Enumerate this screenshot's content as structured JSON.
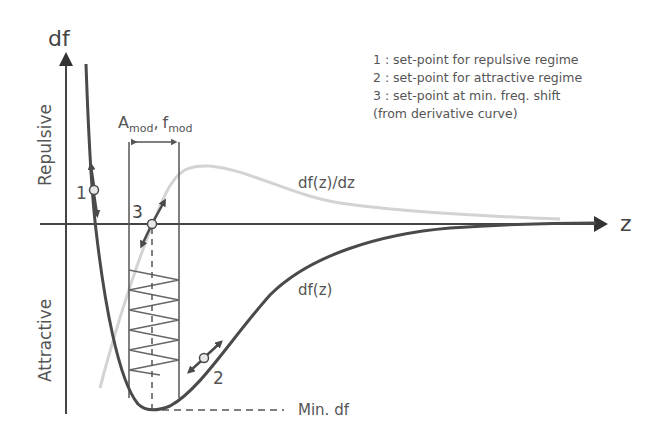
{
  "axes": {
    "y_label": "df",
    "x_label": "z",
    "upper_region": "Repulsive",
    "lower_region": "Attractive"
  },
  "curves": {
    "df": {
      "label": "df(z)",
      "color": "#4a4a4a"
    },
    "derivative": {
      "label": "df(z)/dz",
      "color": "#cfcfcf"
    }
  },
  "modulation": {
    "label_A": "A",
    "label_A_sub": "mod",
    "label_sep": ",",
    "label_f": "f",
    "label_f_sub": "mod"
  },
  "setpoints": [
    {
      "id": "1",
      "label": "1"
    },
    {
      "id": "2",
      "label": "2"
    },
    {
      "id": "3",
      "label": "3"
    }
  ],
  "min_label": "Min. df",
  "legend": [
    "1 : set-point for repulsive regime",
    "2 : set-point for attractive regime",
    "3 : set-point at min. freq. shift",
    "(from derivative curve)"
  ]
}
